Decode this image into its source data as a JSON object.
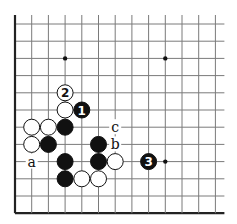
{
  "board": {
    "cols": 13,
    "rows": 12,
    "origin_x": 15,
    "origin_y": 24,
    "dx": 16.7,
    "dy": 17.2,
    "edges": [
      "left",
      "bottom"
    ],
    "stone_radius": 8,
    "colors": {
      "black": "#111111",
      "white": "#ffffff",
      "line": "#7a7a7a"
    }
  },
  "star_points": [
    {
      "col": 3,
      "row": 2
    },
    {
      "col": 9,
      "row": 2
    },
    {
      "col": 9,
      "row": 8
    }
  ],
  "stones": [
    {
      "col": 3,
      "row": 4,
      "color": "white",
      "label": "2"
    },
    {
      "col": 3,
      "row": 5,
      "color": "white",
      "label": ""
    },
    {
      "col": 4,
      "row": 5,
      "color": "black",
      "label": "1"
    },
    {
      "col": 1,
      "row": 6,
      "color": "white",
      "label": ""
    },
    {
      "col": 2,
      "row": 6,
      "color": "white",
      "label": ""
    },
    {
      "col": 3,
      "row": 6,
      "color": "black",
      "label": ""
    },
    {
      "col": 1,
      "row": 7,
      "color": "white",
      "label": ""
    },
    {
      "col": 2,
      "row": 7,
      "color": "black",
      "label": ""
    },
    {
      "col": 5,
      "row": 7,
      "color": "black",
      "label": ""
    },
    {
      "col": 3,
      "row": 8,
      "color": "black",
      "label": ""
    },
    {
      "col": 5,
      "row": 8,
      "color": "black",
      "label": ""
    },
    {
      "col": 6,
      "row": 8,
      "color": "white",
      "label": ""
    },
    {
      "col": 8,
      "row": 8,
      "color": "black",
      "label": "3"
    },
    {
      "col": 3,
      "row": 9,
      "color": "black",
      "label": ""
    },
    {
      "col": 4,
      "row": 9,
      "color": "white",
      "label": ""
    },
    {
      "col": 5,
      "row": 9,
      "color": "white",
      "label": ""
    }
  ],
  "letters": [
    {
      "col": 1,
      "row": 8,
      "text": "a"
    },
    {
      "col": 6,
      "row": 7,
      "text": "b"
    },
    {
      "col": 6,
      "row": 6,
      "text": "c"
    }
  ]
}
